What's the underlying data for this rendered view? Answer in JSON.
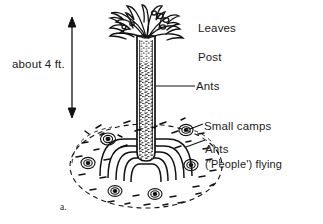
{
  "figure": {
    "caption": "a.",
    "scale_label": "about 4 ft."
  },
  "labels": {
    "leaves": "Leaves",
    "post": "Post",
    "ants_on_post": "Ants",
    "small_camps": "Small  camps",
    "ants_flying_line1": "Ants",
    "ants_flying_line2": "('People') flying"
  },
  "colors": {
    "ink": "#111111",
    "text": "#1b1b1b",
    "background": "#ffffff",
    "stipple": "#2a2a2a"
  }
}
